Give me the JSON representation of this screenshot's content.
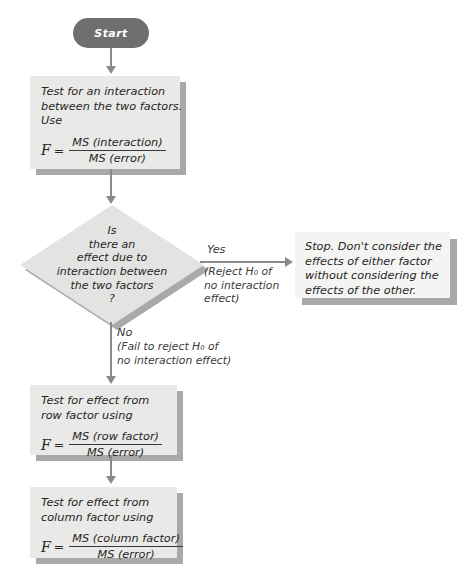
{
  "diagram": {
    "colors": {
      "box_fill": "#e9e9e7",
      "box_fill_light": "#f4f4f2",
      "shadow": "#a9a9a7",
      "diamond_fill": "#e3e3e1",
      "terminator_fill": "#6f6f6f",
      "connector": "#8a8a8a",
      "text": "#262626"
    },
    "start": {
      "label": "Start"
    },
    "step_interaction": {
      "line1": "Test for an interaction",
      "line2": "between the two factors.",
      "line3": "Use",
      "formula": {
        "variable": "F",
        "equals": "=",
        "numerator": "MS (interaction)",
        "denominator": "MS (error)"
      }
    },
    "decision": {
      "line1": "Is",
      "line2": "there an",
      "line3": "effect due to",
      "line4": "interaction between",
      "line5": "the two factors",
      "line6": "?"
    },
    "branch_yes": {
      "label": "Yes",
      "sub1": "(Reject H₀ of",
      "sub2": "no interaction",
      "sub3": "effect)"
    },
    "branch_no": {
      "label": "No",
      "sub1": "(Fail to reject H₀ of",
      "sub2": "no interaction effect)"
    },
    "stop_box": {
      "line1": "Stop. Don't consider the",
      "line2": "effects of either factor",
      "line3": "without considering the",
      "line4": "effects of the other."
    },
    "step_row": {
      "line1": "Test for effect from",
      "line2": "row factor using",
      "formula": {
        "variable": "F",
        "equals": "=",
        "numerator": "MS (row factor)",
        "denominator": "MS (error)"
      }
    },
    "step_column": {
      "line1": "Test for effect from",
      "line2": "column factor using",
      "formula": {
        "variable": "F",
        "equals": "=",
        "numerator": "MS (column factor)",
        "denominator": "MS (error)"
      }
    }
  }
}
